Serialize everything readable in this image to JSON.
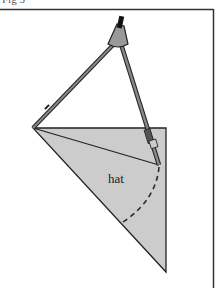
{
  "caption": "Fig 5",
  "figure": {
    "label": "hat",
    "colors": {
      "frame": "#333333",
      "fill": "#cccccc",
      "line": "#222222",
      "compass_body": "#888888",
      "compass_hinge": "#999999"
    }
  }
}
